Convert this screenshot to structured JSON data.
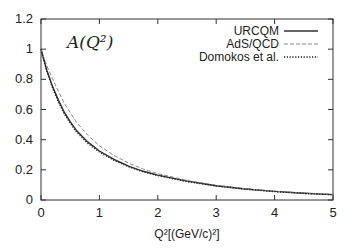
{
  "chart_data": {
    "type": "line",
    "title": "",
    "annotation": "A(Q²)",
    "xlabel": "Q²[(GeV/c)²]",
    "ylabel": "",
    "xlim": [
      0,
      5
    ],
    "ylim": [
      0,
      1.2
    ],
    "x_ticks": [
      "0",
      "1",
      "2",
      "3",
      "4",
      "5"
    ],
    "y_ticks": [
      "0",
      "0.2",
      "0.4",
      "0.6",
      "0.8",
      "1",
      "1.2"
    ],
    "grid": false,
    "legend_position": "top-right",
    "x": [
      0,
      0.1,
      0.2,
      0.3,
      0.4,
      0.5,
      0.6,
      0.8,
      1.0,
      1.25,
      1.5,
      1.75,
      2.0,
      2.5,
      3.0,
      3.5,
      4.0,
      4.5,
      5.0
    ],
    "series": [
      {
        "name": "URCQM",
        "style": "solid",
        "values": [
          1.0,
          0.86,
          0.75,
          0.66,
          0.58,
          0.52,
          0.465,
          0.385,
          0.325,
          0.27,
          0.225,
          0.19,
          0.165,
          0.125,
          0.095,
          0.073,
          0.057,
          0.045,
          0.036
        ]
      },
      {
        "name": "AdS/QCD",
        "style": "dashed",
        "values": [
          1.0,
          0.89,
          0.8,
          0.72,
          0.64,
          0.58,
          0.52,
          0.43,
          0.36,
          0.295,
          0.245,
          0.205,
          0.175,
          0.13,
          0.098,
          0.075,
          0.058,
          0.046,
          0.037
        ]
      },
      {
        "name": "Domokos et al.",
        "style": "dotted",
        "values": [
          1.0,
          0.855,
          0.74,
          0.65,
          0.57,
          0.51,
          0.455,
          0.375,
          0.318,
          0.263,
          0.22,
          0.187,
          0.162,
          0.122,
          0.093,
          0.072,
          0.056,
          0.044,
          0.035
        ]
      }
    ]
  }
}
